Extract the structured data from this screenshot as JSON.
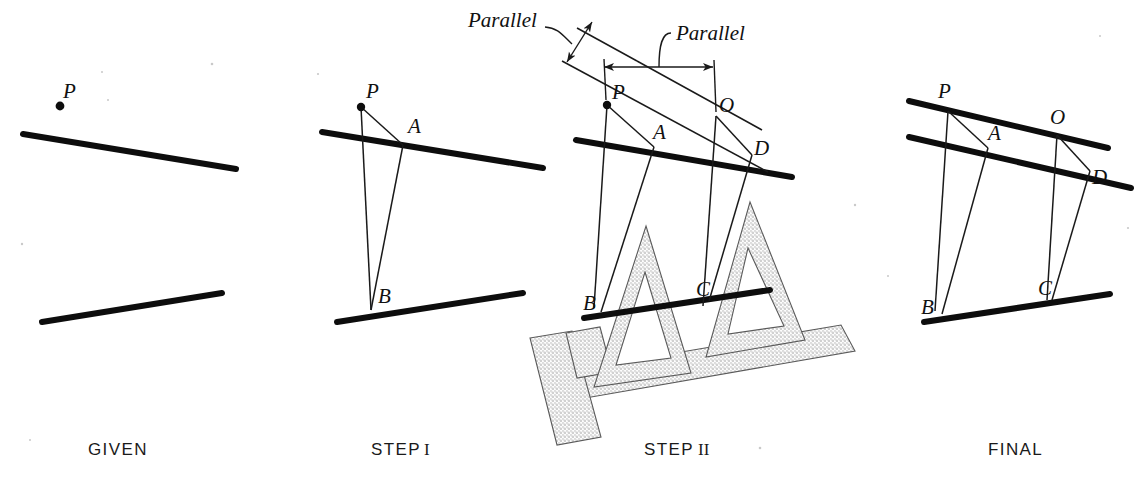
{
  "figure": {
    "panels": [
      {
        "id": "given",
        "caption": "GIVEN",
        "point_labels": [
          "P"
        ],
        "description": "A point P and two given lines"
      },
      {
        "id": "step1",
        "caption": "STEP I",
        "caption_numeral": "",
        "point_labels": [
          "P",
          "A",
          "B"
        ],
        "description": "Construct triangle P-A-B from point P to the two lines"
      },
      {
        "id": "step2",
        "caption": "STEP II",
        "caption_numeral": "",
        "point_labels": [
          "P",
          "A",
          "O",
          "D",
          "B",
          "C"
        ],
        "annotations": [
          "Parallel",
          "Parallel"
        ],
        "description": "Slide the triangle along the T-square to transfer the parallel"
      },
      {
        "id": "final",
        "caption": "FINAL",
        "point_labels": [
          "P",
          "A",
          "O",
          "D",
          "B",
          "C"
        ],
        "description": "Completed construction with the new parallel line through P and O"
      }
    ],
    "annotation_labels": {
      "parallel_left": "Parallel",
      "parallel_right": "Parallel"
    },
    "vertex_labels": {
      "P": "P",
      "A": "A",
      "B": "B",
      "C": "C",
      "D": "D",
      "O": "O"
    },
    "captions": {
      "given": "GIVEN",
      "step1_word": "STEP",
      "step1_numeral": "I",
      "step2_word": "STEP",
      "step2_numeral": "II",
      "final": "FINAL"
    },
    "colors": {
      "ink": "#0d0d0d",
      "thin_ink": "#1a1a1a",
      "tool_outline": "#5a5a5a",
      "tool_stipple": "#8a8a8a",
      "background": "#ffffff"
    }
  }
}
